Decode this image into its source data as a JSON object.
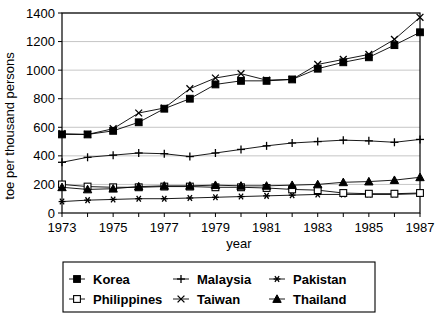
{
  "chart_data": {
    "type": "line",
    "title": "",
    "xlabel": "year",
    "ylabel": "toe per thousand persons",
    "x": [
      1973,
      1974,
      1975,
      1976,
      1977,
      1978,
      1979,
      1980,
      1981,
      1982,
      1983,
      1984,
      1985,
      1986,
      1987
    ],
    "xlim": [
      1973,
      1987
    ],
    "ylim": [
      0,
      1400
    ],
    "yticks": [
      0,
      200,
      400,
      600,
      800,
      1000,
      1200,
      1400
    ],
    "xticks": [
      1973,
      1974,
      1975,
      1976,
      1977,
      1978,
      1979,
      1980,
      1981,
      1982,
      1983,
      1984,
      1985,
      1986,
      1987
    ],
    "xtick_labels": [
      "1973",
      "",
      "1975",
      "",
      "1977",
      "",
      "1979",
      "",
      "1981",
      "",
      "1983",
      "",
      "1985",
      "",
      "1987"
    ],
    "grid": true,
    "legend_position": "below",
    "series": [
      {
        "name": "Korea",
        "marker": "filled-square",
        "values": [
          550,
          550,
          575,
          635,
          730,
          800,
          900,
          925,
          925,
          935,
          1010,
          1055,
          1090,
          1175,
          1265
        ]
      },
      {
        "name": "Malaysia",
        "marker": "plus",
        "values": [
          355,
          390,
          405,
          420,
          415,
          395,
          420,
          445,
          470,
          490,
          500,
          510,
          505,
          495,
          515
        ]
      },
      {
        "name": "Pakistan",
        "marker": "asterisk",
        "values": [
          80,
          90,
          95,
          100,
          100,
          105,
          110,
          115,
          120,
          125,
          130,
          130,
          130,
          130,
          135
        ]
      },
      {
        "name": "Philippines",
        "marker": "open-square",
        "values": [
          200,
          185,
          180,
          180,
          185,
          185,
          180,
          180,
          175,
          165,
          160,
          140,
          135,
          135,
          140
        ]
      },
      {
        "name": "Taiwan",
        "marker": "cross",
        "values": [
          555,
          550,
          590,
          700,
          735,
          870,
          945,
          975,
          930,
          935,
          1040,
          1075,
          1110,
          1215,
          1370
        ]
      },
      {
        "name": "Thailand",
        "marker": "filled-triangle",
        "values": [
          180,
          165,
          170,
          185,
          190,
          190,
          195,
          190,
          190,
          195,
          200,
          215,
          220,
          230,
          250
        ]
      }
    ]
  },
  "legend": {
    "items": [
      {
        "label": "Korea",
        "marker": "filled-square"
      },
      {
        "label": "Malaysia",
        "marker": "plus"
      },
      {
        "label": "Pakistan",
        "marker": "asterisk"
      },
      {
        "label": "Philippines",
        "marker": "open-square"
      },
      {
        "label": "Taiwan",
        "marker": "cross"
      },
      {
        "label": "Thailand",
        "marker": "filled-triangle"
      }
    ]
  },
  "colors": {
    "ink": "#000000",
    "grid": "#b8b8b8",
    "background": "#ffffff"
  }
}
